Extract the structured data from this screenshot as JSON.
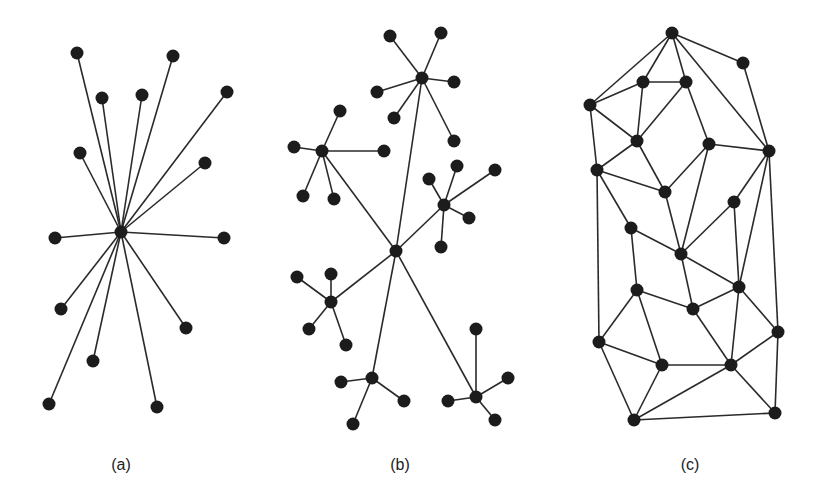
{
  "figure": {
    "panels": [
      {
        "id": "a",
        "caption": "(a)",
        "caption_pos": [
          121,
          466
        ],
        "type": "star",
        "nodes": [
          [
            121,
            232
          ],
          [
            77,
            53
          ],
          [
            173,
            56
          ],
          [
            102,
            98
          ],
          [
            142,
            95
          ],
          [
            227,
            92
          ],
          [
            80,
            153
          ],
          [
            205,
            163
          ],
          [
            55,
            238
          ],
          [
            224,
            238
          ],
          [
            61,
            309
          ],
          [
            186,
            328
          ],
          [
            93,
            361
          ],
          [
            49,
            404
          ],
          [
            157,
            407
          ]
        ],
        "edges": [
          [
            0,
            1
          ],
          [
            0,
            2
          ],
          [
            0,
            3
          ],
          [
            0,
            4
          ],
          [
            0,
            5
          ],
          [
            0,
            6
          ],
          [
            0,
            7
          ],
          [
            0,
            8
          ],
          [
            0,
            9
          ],
          [
            0,
            10
          ],
          [
            0,
            11
          ],
          [
            0,
            12
          ],
          [
            0,
            13
          ],
          [
            0,
            14
          ]
        ]
      },
      {
        "id": "b",
        "caption": "(b)",
        "caption_pos": [
          400,
          466
        ],
        "type": "hierarchical",
        "nodes": [
          [
            396,
            251
          ],
          [
            422,
            78
          ],
          [
            390,
            36
          ],
          [
            441,
            33
          ],
          [
            454,
            82
          ],
          [
            377,
            92
          ],
          [
            394,
            118
          ],
          [
            454,
            141
          ],
          [
            322,
            151
          ],
          [
            340,
            111
          ],
          [
            294,
            147
          ],
          [
            384,
            151
          ],
          [
            303,
            196
          ],
          [
            334,
            199
          ],
          [
            444,
            205
          ],
          [
            429,
            179
          ],
          [
            457,
            166
          ],
          [
            495,
            170
          ],
          [
            469,
            218
          ],
          [
            441,
            247
          ],
          [
            331,
            302
          ],
          [
            297,
            277
          ],
          [
            331,
            274
          ],
          [
            309,
            329
          ],
          [
            346,
            345
          ],
          [
            372,
            378
          ],
          [
            341,
            382
          ],
          [
            404,
            401
          ],
          [
            353,
            424
          ],
          [
            476,
            397
          ],
          [
            476,
            329
          ],
          [
            508,
            378
          ],
          [
            448,
            401
          ],
          [
            495,
            420
          ]
        ],
        "edges": [
          [
            0,
            1
          ],
          [
            0,
            8
          ],
          [
            0,
            14
          ],
          [
            0,
            20
          ],
          [
            0,
            25
          ],
          [
            0,
            29
          ],
          [
            1,
            2
          ],
          [
            1,
            3
          ],
          [
            1,
            4
          ],
          [
            1,
            5
          ],
          [
            1,
            6
          ],
          [
            1,
            7
          ],
          [
            8,
            9
          ],
          [
            8,
            10
          ],
          [
            8,
            11
          ],
          [
            8,
            12
          ],
          [
            8,
            13
          ],
          [
            14,
            15
          ],
          [
            14,
            16
          ],
          [
            14,
            17
          ],
          [
            14,
            18
          ],
          [
            14,
            19
          ],
          [
            20,
            21
          ],
          [
            20,
            22
          ],
          [
            20,
            23
          ],
          [
            20,
            24
          ],
          [
            25,
            26
          ],
          [
            25,
            27
          ],
          [
            25,
            28
          ],
          [
            29,
            30
          ],
          [
            29,
            31
          ],
          [
            29,
            32
          ],
          [
            29,
            33
          ]
        ]
      },
      {
        "id": "c",
        "caption": "(c)",
        "caption_pos": [
          690,
          466
        ],
        "type": "planar-mesh",
        "nodes": [
          [
            672,
            33
          ],
          [
            743,
            63
          ],
          [
            643,
            82
          ],
          [
            686,
            82
          ],
          [
            590,
            105
          ],
          [
            637,
            141
          ],
          [
            709,
            144
          ],
          [
            769,
            151
          ],
          [
            597,
            170
          ],
          [
            665,
            192
          ],
          [
            734,
            202
          ],
          [
            631,
            228
          ],
          [
            681,
            254
          ],
          [
            739,
            287
          ],
          [
            637,
            290
          ],
          [
            693,
            309
          ],
          [
            599,
            342
          ],
          [
            662,
            365
          ],
          [
            778,
            332
          ],
          [
            731,
            365
          ],
          [
            634,
            420
          ],
          [
            775,
            413
          ]
        ],
        "edges": [
          [
            0,
            1
          ],
          [
            0,
            2
          ],
          [
            0,
            3
          ],
          [
            0,
            4
          ],
          [
            0,
            7
          ],
          [
            1,
            7
          ],
          [
            2,
            3
          ],
          [
            2,
            4
          ],
          [
            2,
            5
          ],
          [
            3,
            5
          ],
          [
            3,
            6
          ],
          [
            4,
            5
          ],
          [
            4,
            8
          ],
          [
            5,
            8
          ],
          [
            5,
            9
          ],
          [
            6,
            9
          ],
          [
            6,
            7
          ],
          [
            6,
            12
          ],
          [
            7,
            10
          ],
          [
            7,
            13
          ],
          [
            7,
            18
          ],
          [
            8,
            9
          ],
          [
            8,
            11
          ],
          [
            8,
            16
          ],
          [
            9,
            12
          ],
          [
            10,
            12
          ],
          [
            10,
            13
          ],
          [
            11,
            12
          ],
          [
            11,
            14
          ],
          [
            12,
            13
          ],
          [
            12,
            15
          ],
          [
            13,
            15
          ],
          [
            13,
            19
          ],
          [
            13,
            18
          ],
          [
            14,
            15
          ],
          [
            14,
            16
          ],
          [
            14,
            17
          ],
          [
            15,
            19
          ],
          [
            16,
            17
          ],
          [
            16,
            20
          ],
          [
            17,
            19
          ],
          [
            17,
            20
          ],
          [
            18,
            19
          ],
          [
            18,
            21
          ],
          [
            19,
            20
          ],
          [
            19,
            21
          ],
          [
            20,
            21
          ]
        ]
      }
    ],
    "style": {
      "node_color": "#1c1c1c",
      "edge_color": "#2a2a2a",
      "node_radius": 6.5
    }
  }
}
